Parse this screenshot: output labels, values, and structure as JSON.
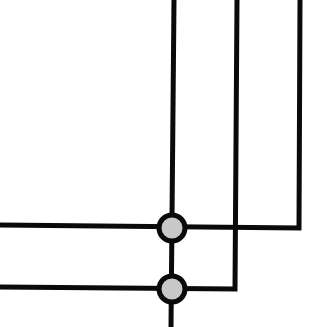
{
  "diagram": {
    "type": "wiring-junction-diagram",
    "background": "#ffffff",
    "line_color": "#0a0a0a",
    "junction_fill": "#c8c8c8",
    "wires": [
      {
        "name": "center-vertical-wire",
        "points": [
          [
            174,
            0
          ],
          [
            171,
            327
          ]
        ]
      },
      {
        "name": "middle-vertical-wire",
        "points": [
          [
            237,
            0
          ],
          [
            235,
            289
          ],
          [
            0,
            287
          ]
        ]
      },
      {
        "name": "right-vertical-wire",
        "points": [
          [
            300,
            0
          ],
          [
            299,
            228
          ],
          [
            0,
            225
          ]
        ]
      }
    ],
    "junctions": [
      {
        "name": "upper-junction",
        "cx": 172,
        "cy": 228,
        "r": 13
      },
      {
        "name": "lower-junction",
        "cx": 172,
        "cy": 289,
        "r": 13
      }
    ]
  }
}
